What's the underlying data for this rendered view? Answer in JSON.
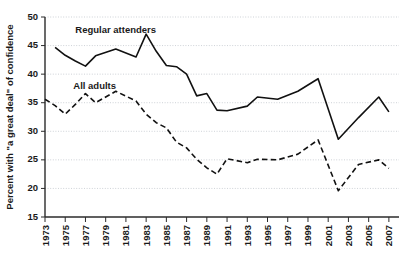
{
  "chart_data": {
    "type": "line",
    "title": "",
    "xlabel": "",
    "ylabel": "Percent with \"a great deal\" of confidence",
    "xlim": [
      1973,
      2008
    ],
    "ylim": [
      15,
      50
    ],
    "grid": true,
    "legend_position": "inline-labels",
    "ytick_labels": [
      "15",
      "20",
      "25",
      "30",
      "35",
      "40",
      "45",
      "50"
    ],
    "ytick_values": [
      15,
      20,
      25,
      30,
      35,
      40,
      45,
      50
    ],
    "xtick_labels": [
      "1973",
      "1975",
      "1977",
      "1979",
      "1981",
      "1983",
      "1985",
      "1987",
      "1989",
      "1991",
      "1993",
      "1995",
      "1997",
      "1999",
      "2001",
      "2003",
      "2005",
      "2007"
    ],
    "xtick_values": [
      1973,
      1975,
      1977,
      1979,
      1981,
      1983,
      1985,
      1987,
      1989,
      1991,
      1993,
      1995,
      1997,
      1999,
      2001,
      2003,
      2005,
      2007
    ],
    "series": [
      {
        "name": "Regular attenders",
        "style": "solid",
        "label_x": 1976.0,
        "label_y": 47.2,
        "x": [
          1974,
          1975,
          1976,
          1977,
          1978,
          1980,
          1982,
          1983,
          1984,
          1985,
          1986,
          1987,
          1988,
          1989,
          1990,
          1991,
          1993,
          1994,
          1996,
          1998,
          2000,
          2002,
          2004,
          2006,
          2007
        ],
        "values": [
          44.7,
          43.3,
          42.3,
          41.4,
          43.2,
          44.4,
          43.0,
          47.0,
          44.0,
          41.5,
          41.3,
          40.0,
          36.2,
          36.6,
          33.7,
          33.6,
          34.4,
          36.0,
          35.6,
          37.0,
          39.2,
          28.6,
          32.4,
          36.0,
          33.4
        ]
      },
      {
        "name": "All adults",
        "style": "dashed",
        "label_x": 1975.8,
        "label_y": 37.4,
        "x": [
          1973,
          1974,
          1975,
          1976,
          1977,
          1978,
          1980,
          1982,
          1983,
          1984,
          1985,
          1986,
          1987,
          1988,
          1989,
          1990,
          1991,
          1993,
          1994,
          1996,
          1998,
          2000,
          2002,
          2004,
          2006,
          2007
        ],
        "values": [
          35.6,
          34.5,
          33.0,
          34.7,
          36.6,
          35.0,
          37.0,
          35.3,
          33.0,
          31.5,
          30.6,
          28.1,
          27.1,
          25.1,
          23.6,
          22.5,
          25.2,
          24.5,
          25.1,
          25.0,
          26.0,
          28.5,
          19.6,
          24.2,
          25.0,
          23.5
        ]
      }
    ]
  },
  "caption": {
    "text": ""
  }
}
